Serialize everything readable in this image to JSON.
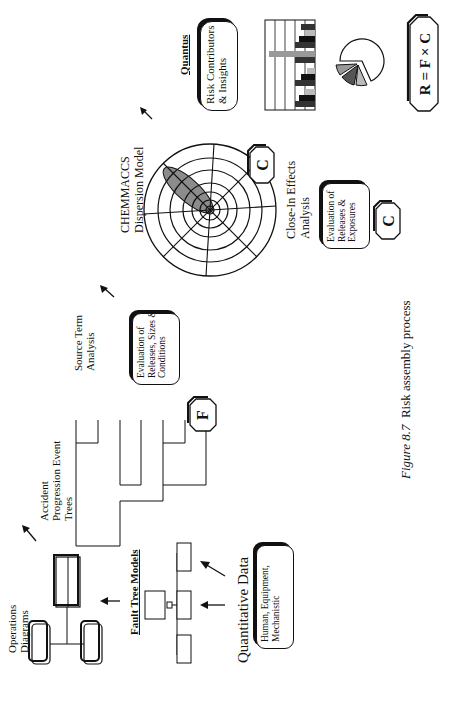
{
  "figure": {
    "number_label": "Figure 8.7",
    "title": "Risk assembly process",
    "orientation": "rotated 90° counterclockwise on page"
  },
  "stages": {
    "operations": {
      "label_line1": "Operations",
      "label_line2": "Diagrams"
    },
    "fault_tree": {
      "label": "Fault Tree Models"
    },
    "quantitative_data": {
      "label": "Quantitative Data",
      "box_line1": "Human, Equipment,",
      "box_line2": "Mechanistic"
    },
    "event_trees": {
      "label_line1": "Accident",
      "label_line2": "Progression Event",
      "label_line3": "Trees"
    },
    "frequency_badge": {
      "symbol": "F"
    },
    "source_term": {
      "label_line1": "Source Term",
      "label_line2": "Analysis",
      "box_line1": "Evaluation of",
      "box_line2": "Releases, Sizes &",
      "box_line3": "Conditions"
    },
    "dispersion": {
      "label_line1": "CHEMMACCS",
      "label_line2": "Dispersion Model",
      "badge": "C"
    },
    "close_in": {
      "label_line1": "Close-In Effects",
      "label_line2": "Analysis",
      "box_line1": "Evaluation of",
      "box_line2": "Releases &",
      "box_line3": "Exposures",
      "badge": "C"
    },
    "quantus": {
      "label": "Quantus",
      "box_line1": "Risk Contributors",
      "box_line2": "& Insights"
    },
    "equation": {
      "text": "R = F × C"
    }
  },
  "colors": {
    "ink": "#111111",
    "plume": "#8c8c8c",
    "bar_dark": "#333333",
    "bar_mid": "#777777",
    "bar_light": "#bbbbbb",
    "background": "#ffffff"
  }
}
